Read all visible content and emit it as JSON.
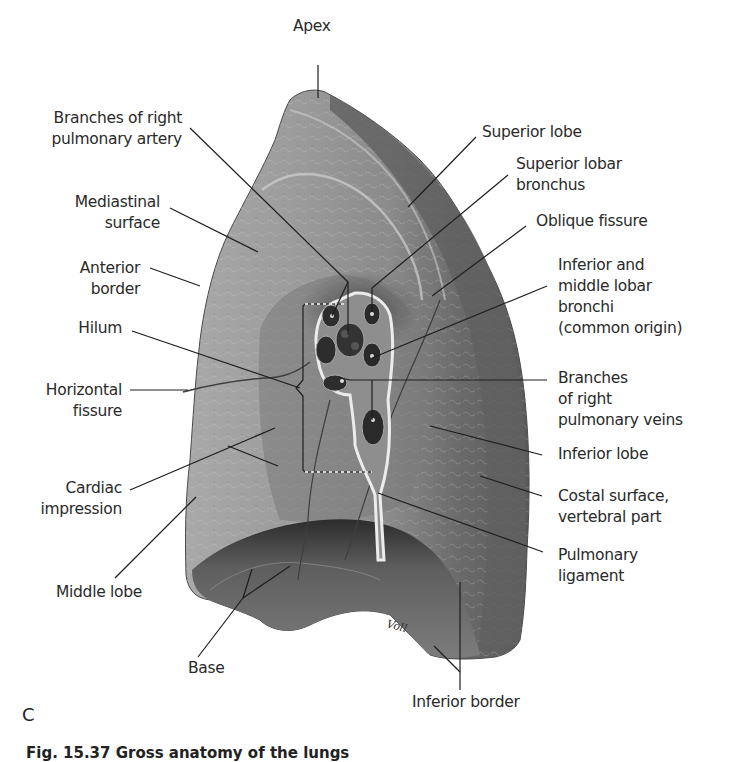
{
  "figure": {
    "panel_letter": "C",
    "caption": "Fig. 15.37  Gross anatomy of the lungs",
    "artist_signature": "Voll",
    "colors": {
      "background": "#ffffff",
      "label_text": "#2a2a2a",
      "leader_line": "#1e1e1e",
      "lung_light": "#b4b4b4",
      "lung_mid": "#8c8c8c",
      "lung_dark": "#5a5a5a",
      "lung_shadow": "#2e2e2e",
      "hilum_outline": "#e8e8e8"
    }
  },
  "labels": {
    "apex": "Apex",
    "branches_right_pulmonary_artery": "Branches of right\npulmonary artery",
    "mediastinal_surface": "Mediastinal\nsurface",
    "anterior_border": "Anterior\nborder",
    "hilum": "Hilum",
    "horizontal_fissure": "Horizontal\nfissure",
    "cardiac_impression": "Cardiac\nimpression",
    "middle_lobe": "Middle lobe",
    "base": "Base",
    "superior_lobe": "Superior lobe",
    "superior_lobar_bronchus": "Superior lobar\nbronchus",
    "oblique_fissure": "Oblique fissure",
    "inferior_middle_lobar_bronchi": "Inferior and\nmiddle lobar\nbronchi\n(common origin)",
    "branches_right_pulmonary_veins": "Branches\nof right\npulmonary veins",
    "inferior_lobe": "Inferior lobe",
    "costal_surface_vertebral_part": "Costal surface,\nvertebral part",
    "pulmonary_ligament": "Pulmonary\nligament",
    "inferior_border": "Inferior border"
  }
}
